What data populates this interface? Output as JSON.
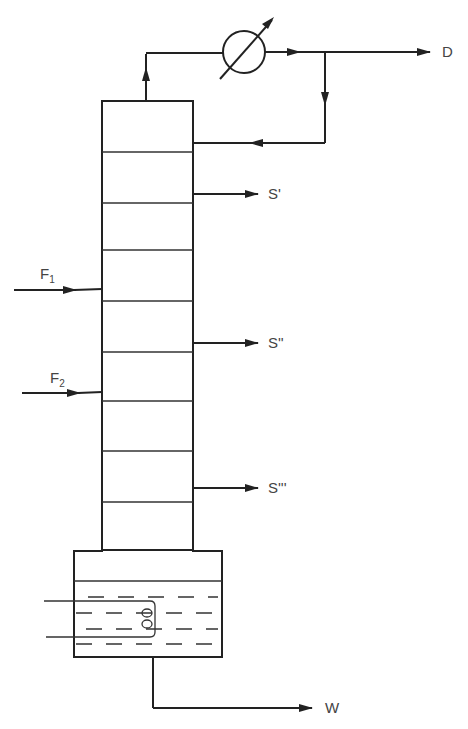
{
  "diagram": {
    "streams": {
      "distillate": "D",
      "bottoms": "W",
      "feed_1": "F",
      "feed_1_sub": "1",
      "feed_2": "F",
      "feed_2_sub": "2",
      "side_1": "S'",
      "side_2": "S''",
      "side_3": "S'''"
    },
    "components": {
      "condenser": "heat-exchanger-icon",
      "column": "tray-column",
      "reboiler": "reboiler-vessel",
      "heating_coil": "coil-icon"
    },
    "tray_count": 9,
    "colors": {
      "line": "#222222",
      "label": "#444444",
      "background": "#ffffff"
    }
  }
}
